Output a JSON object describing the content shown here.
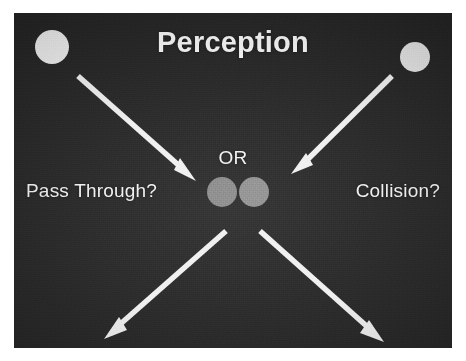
{
  "slide": {
    "title": "Perception",
    "or_label": "OR",
    "left_label": "Pass Through?",
    "right_label": "Collision?",
    "background_color": "#262626",
    "text_color": "#f4f4f4",
    "canvas_background": "#ffffff"
  },
  "objects": {
    "incoming_balls": [
      {
        "name": "ball-top-left",
        "cx": 38,
        "cy": 34,
        "r": 17,
        "color": "#f2f2f2"
      },
      {
        "name": "ball-top-right",
        "cx": 401,
        "cy": 44,
        "r": 15,
        "color": "#e8e8e8"
      }
    ],
    "center_balls": [
      {
        "name": "ball-center-left",
        "cx": 208,
        "cy": 179,
        "r": 15,
        "color": "#8a8a8a"
      },
      {
        "name": "ball-center-right",
        "cx": 240,
        "cy": 179,
        "r": 15,
        "color": "#909090"
      }
    ],
    "arrows": [
      {
        "name": "arrow-incoming-left",
        "x1": 64,
        "y1": 63,
        "x2": 178,
        "y2": 164,
        "color": "#f0f0f0",
        "direction": "down-right"
      },
      {
        "name": "arrow-incoming-right",
        "x1": 378,
        "y1": 63,
        "x2": 280,
        "y2": 160,
        "color": "#f0f0f0",
        "direction": "down-left"
      },
      {
        "name": "arrow-outgoing-left",
        "x1": 212,
        "y1": 218,
        "x2": 92,
        "y2": 324,
        "color": "#f0f0f0",
        "direction": "down-left"
      },
      {
        "name": "arrow-outgoing-right",
        "x1": 246,
        "y1": 218,
        "x2": 370,
        "y2": 328,
        "color": "#f0f0f0",
        "direction": "down-right"
      }
    ]
  }
}
